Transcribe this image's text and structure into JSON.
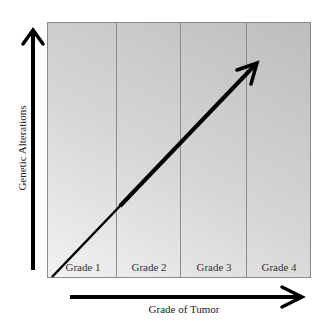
{
  "diagram": {
    "y_axis_label": "Genetic Alterations",
    "x_axis_label": "Grade of Tumor",
    "columns": [
      {
        "label": "Grade 1"
      },
      {
        "label": "Grade 2"
      },
      {
        "label": "Grade 3"
      },
      {
        "label": "Grade 4"
      }
    ],
    "trend": "increasing diagonal arrow from Grade 1 (low) to Grade 4 (high)",
    "colors": {
      "panel_light": "#f2f2f2",
      "panel_dark": "#bdbdbd",
      "arrow": "#000000",
      "divider": "#8c8c8c"
    }
  }
}
